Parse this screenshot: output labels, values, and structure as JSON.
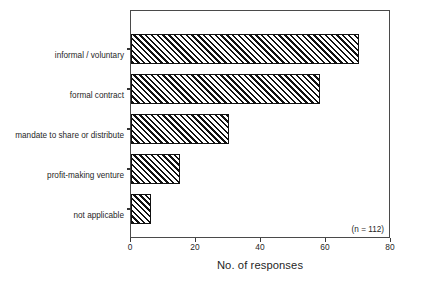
{
  "chart_data": {
    "type": "bar",
    "orientation": "horizontal",
    "title": "",
    "xlabel": "No. of responses",
    "ylabel": "",
    "xlim": [
      0,
      80
    ],
    "ylim": null,
    "grid": false,
    "legend": null,
    "xticks": [
      0,
      20,
      40,
      60,
      80
    ],
    "xtick_labels": [
      "0",
      "20",
      "40",
      "60",
      "80"
    ],
    "categories": [
      "informal / voluntary",
      "formal contract",
      "mandate to share or distribute",
      "profit-making venture",
      "not applicable"
    ],
    "values": [
      70,
      58,
      30,
      15,
      6
    ],
    "bar_style": {
      "fill": "diagonal-hatch",
      "hatch_color": "#111111",
      "background_color": "#ffffff",
      "edge_color": "#111111"
    },
    "annotations": [
      {
        "name": "sample-size",
        "text": "(n = 112)",
        "position": "inside-plot-bottom-right"
      }
    ]
  },
  "axis": {
    "x_title": "No. of responses",
    "tick_labels": [
      "0",
      "20",
      "40",
      "60",
      "80"
    ]
  },
  "categories": [
    {
      "label": "informal / voluntary"
    },
    {
      "label": "formal contract"
    },
    {
      "label": "mandate to share or distribute"
    },
    {
      "label": "profit-making venture"
    },
    {
      "label": "not applicable"
    }
  ],
  "annotation": {
    "sample_size": "(n = 112)"
  }
}
